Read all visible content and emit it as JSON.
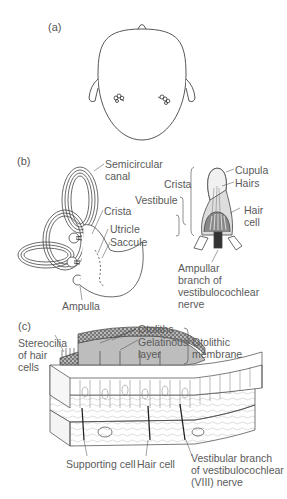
{
  "figure": {
    "panels": [
      {
        "id": "a",
        "label": "(a)",
        "description": "Top view of head showing bilateral position of inner ears"
      },
      {
        "id": "b",
        "label": "(b)",
        "labels": {
          "semicircular_canal_1": "Semicircular",
          "semicircular_canal_2": "canal",
          "crista_left": "Crista",
          "utricle": "Utricle",
          "saccule": "Saccule",
          "ampulla": "Ampulla",
          "crista_right": "Crista",
          "vestibule": "Vestibule",
          "cupula": "Cupula",
          "hairs": "Hairs",
          "hair_cell_1": "Hair",
          "hair_cell_2": "cell",
          "ampullar_1": "Ampullar",
          "ampullar_2": "branch of",
          "ampullar_3": "vestibulocochlear",
          "ampullar_4": "nerve"
        }
      },
      {
        "id": "c",
        "label": "(c)",
        "labels": {
          "stereocilia_1": "Stereocilia",
          "stereocilia_2": "of hair",
          "stereocilia_3": "cells",
          "otoliths": "Otoliths",
          "gelatinous_1": "Gelatinous",
          "gelatinous_2": "layer",
          "otolithic_1": "Otolithic",
          "otolithic_2": "membrane",
          "supporting_cell": "Supporting cell",
          "hair_cell": "Hair cell",
          "vestibular_1": "Vestibular branch",
          "vestibular_2": "of vestibulocochlear",
          "vestibular_3": "(VIII) nerve"
        }
      }
    ]
  }
}
